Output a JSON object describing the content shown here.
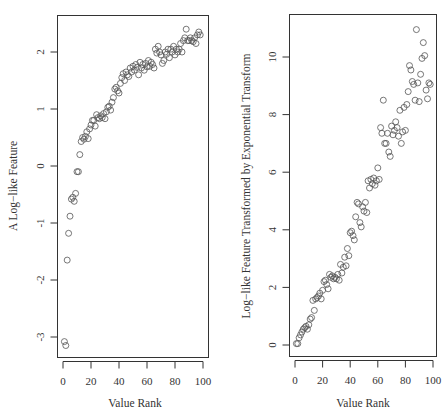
{
  "chart_data": [
    {
      "type": "scatter",
      "title": "",
      "xlabel": "Value Rank",
      "ylabel": "A Log−like Feature",
      "xlim": [
        0,
        100
      ],
      "ylim": [
        -3.2,
        2.6
      ],
      "xticks": [
        0,
        20,
        40,
        60,
        80,
        100
      ],
      "yticks": [
        -3,
        -2,
        -1,
        0,
        1,
        2
      ],
      "grid": false,
      "marker": "open-circle",
      "x": [
        1,
        2,
        3,
        4,
        5,
        6,
        7,
        8,
        9,
        10,
        11,
        12,
        13,
        14,
        15,
        16,
        17,
        18,
        19,
        20,
        21,
        22,
        23,
        24,
        25,
        26,
        27,
        28,
        29,
        30,
        31,
        32,
        33,
        34,
        35,
        36,
        37,
        38,
        39,
        40,
        41,
        42,
        43,
        44,
        45,
        46,
        47,
        48,
        49,
        50,
        51,
        52,
        53,
        54,
        55,
        56,
        57,
        58,
        59,
        60,
        61,
        62,
        63,
        64,
        65,
        66,
        67,
        68,
        69,
        70,
        71,
        72,
        73,
        74,
        75,
        76,
        77,
        78,
        79,
        80,
        81,
        82,
        83,
        84,
        85,
        86,
        87,
        88,
        89,
        90,
        91,
        92,
        93,
        94,
        95,
        96,
        97,
        98
      ],
      "y": [
        -3.08,
        -3.15,
        -1.65,
        -1.18,
        -0.88,
        -0.58,
        -0.55,
        -0.62,
        -0.48,
        -0.1,
        -0.1,
        0.2,
        0.43,
        0.5,
        0.47,
        0.52,
        0.6,
        0.48,
        0.65,
        0.72,
        0.8,
        0.8,
        0.7,
        0.9,
        0.85,
        0.83,
        0.88,
        0.85,
        0.92,
        0.83,
        0.95,
        1.03,
        1.05,
        0.98,
        1.12,
        1.2,
        1.35,
        1.38,
        1.32,
        1.28,
        1.45,
        1.55,
        1.62,
        1.5,
        1.65,
        1.6,
        1.57,
        1.72,
        1.65,
        1.75,
        1.68,
        1.78,
        1.73,
        1.6,
        1.82,
        1.72,
        1.78,
        1.68,
        1.8,
        1.74,
        1.85,
        1.75,
        1.82,
        1.78,
        1.72,
        2.05,
        1.98,
        2.1,
        2.0,
        1.95,
        1.8,
        1.85,
        2.0,
        1.96,
        2.05,
        1.9,
        2.05,
        2.0,
        2.1,
        1.95,
        2.05,
        2.0,
        2.05,
        2.15,
        2.0,
        2.2,
        2.25,
        2.4,
        2.2,
        2.2,
        2.25,
        2.2,
        2.18,
        2.25,
        2.15,
        2.3,
        2.35,
        2.3
      ]
    },
    {
      "type": "scatter",
      "title": "",
      "xlabel": "Value Rank",
      "ylabel": "Log−like Feature Transformed by Exponential Transform",
      "xlim": [
        0,
        100
      ],
      "ylim": [
        -0.4,
        11.5
      ],
      "xticks": [
        0,
        20,
        40,
        60,
        80,
        100
      ],
      "yticks": [
        0,
        2,
        4,
        6,
        8,
        10
      ],
      "grid": false,
      "marker": "open-circle",
      "x": [
        1,
        2,
        3,
        4,
        5,
        6,
        7,
        8,
        9,
        10,
        11,
        12,
        13,
        14,
        15,
        16,
        17,
        18,
        19,
        20,
        21,
        22,
        23,
        24,
        25,
        26,
        27,
        28,
        29,
        30,
        31,
        32,
        33,
        34,
        35,
        36,
        37,
        38,
        39,
        40,
        41,
        42,
        43,
        44,
        45,
        46,
        47,
        48,
        49,
        50,
        51,
        52,
        53,
        54,
        55,
        56,
        57,
        58,
        59,
        60,
        61,
        62,
        63,
        64,
        65,
        66,
        67,
        68,
        69,
        70,
        71,
        72,
        73,
        74,
        75,
        76,
        77,
        78,
        79,
        80,
        81,
        82,
        83,
        84,
        85,
        86,
        87,
        88,
        89,
        90,
        91,
        92,
        93,
        94,
        95,
        96,
        97,
        98
      ],
      "y": [
        0.05,
        0.05,
        0.25,
        0.35,
        0.45,
        0.55,
        0.6,
        0.65,
        0.55,
        0.7,
        0.9,
        0.95,
        1.55,
        1.2,
        1.6,
        1.65,
        1.7,
        1.8,
        1.6,
        1.9,
        2.2,
        2.25,
        2.1,
        1.95,
        2.45,
        2.35,
        2.4,
        2.3,
        2.35,
        2.3,
        2.45,
        2.25,
        2.8,
        2.5,
        2.7,
        3.05,
        2.75,
        3.35,
        3.1,
        3.9,
        3.95,
        3.8,
        3.65,
        4.45,
        4.95,
        4.9,
        4.25,
        4.1,
        4.8,
        4.65,
        4.95,
        4.6,
        5.7,
        5.45,
        5.75,
        5.6,
        5.8,
        5.55,
        5.7,
        6.15,
        5.75,
        7.55,
        7.35,
        8.5,
        7.0,
        7.0,
        7.35,
        6.7,
        6.55,
        7.6,
        7.3,
        7.45,
        7.75,
        7.55,
        7.25,
        8.15,
        7.0,
        7.4,
        8.25,
        7.45,
        8.35,
        8.8,
        9.7,
        9.55,
        9.15,
        9.05,
        8.5,
        10.95,
        9.1,
        8.45,
        9.4,
        9.95,
        10.5,
        10.05,
        8.85,
        8.55,
        9.1,
        9.05
      ]
    }
  ],
  "left_plot": {
    "xlabel": "Value Rank",
    "ylabel": "A Log−like Feature",
    "xtick_labels": [
      "0",
      "20",
      "40",
      "60",
      "80",
      "100"
    ],
    "ytick_labels": [
      "-3",
      "-2",
      "-1",
      "0",
      "1",
      "2"
    ]
  },
  "right_plot": {
    "xlabel": "Value Rank",
    "ylabel": "Log−like Feature Transformed by Exponential Transform",
    "xtick_labels": [
      "0",
      "20",
      "40",
      "60",
      "80",
      "100"
    ],
    "ytick_labels": [
      "0",
      "2",
      "4",
      "6",
      "8",
      "10"
    ]
  }
}
